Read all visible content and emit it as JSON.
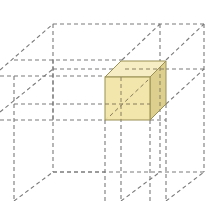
{
  "diagram": {
    "colors": {
      "background": "#ffffff",
      "dashed_line": "#7a7a7a",
      "cube_front": "#f2e4a6",
      "cube_top": "#f6edc4",
      "cube_side": "#ddd08f",
      "cube_edge": "#9a8f55"
    },
    "highlighted_cube": {
      "label": "highlighted cube"
    }
  }
}
